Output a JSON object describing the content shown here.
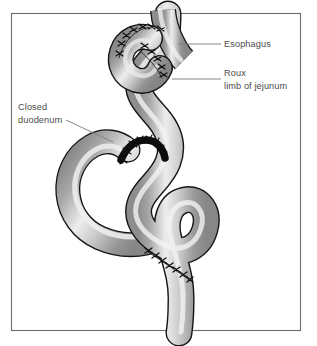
{
  "figure": {
    "border_color": "#6d6d70",
    "background_color": "#ffffff",
    "bowel": {
      "outline_color": "#1a1a1a",
      "shade_dark": "#8d8d8d",
      "shade_mid": "#b6b6b6",
      "highlight": "#f1f1f1",
      "suture_color": "#111111"
    },
    "leader_line_color": "#7a7a7a"
  },
  "labels": {
    "esophagus": {
      "text": "Esophagus",
      "lines": [
        "Esophagus"
      ]
    },
    "roux_limb": {
      "text": "Roux limb of jejunum",
      "lines": [
        "Roux",
        "limb of jejunum"
      ]
    },
    "closed_duodenum": {
      "text": "Closed duodenum",
      "lines": [
        "Closed",
        "duodenum"
      ]
    }
  },
  "annotations": {
    "suture_sites": [
      "esophagojejunostomy",
      "duodenal-stump-closure",
      "jejunojejunostomy"
    ]
  }
}
